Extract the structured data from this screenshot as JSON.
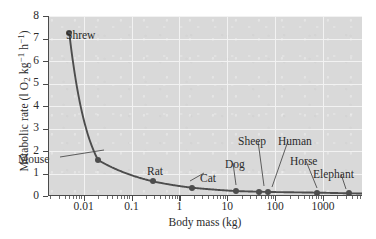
{
  "chart_data": {
    "type": "line",
    "title": "",
    "xlabel": "Body mass (kg)",
    "ylabel": "Metabolic rate (l O2 kg-1 h-1)",
    "ylabel_parts": {
      "lead": "Metabolic rate (l O",
      "sub_2": "2",
      "mid": " kg",
      "sup_1": "−1",
      "mid2": " h",
      "sup_2": "−1",
      "tail": ")"
    },
    "xscale": "log",
    "yscale": "linear",
    "xlim": [
      0.0018,
      6500
    ],
    "ylim": [
      0,
      8
    ],
    "grid": true,
    "legend": "none",
    "xticks": [
      "0.01",
      "0.1",
      "1",
      "10",
      "100",
      "1000"
    ],
    "xtick_values": [
      0.01,
      0.1,
      1,
      10,
      100,
      1000
    ],
    "yticks": [
      "0",
      "1",
      "2",
      "3",
      "4",
      "5",
      "6",
      "7",
      "8"
    ],
    "ytick_values": [
      0,
      1,
      2,
      3,
      4,
      5,
      6,
      7,
      8
    ],
    "series": [
      {
        "name": "Metabolic rate vs body mass",
        "points": [
          {
            "label": "Shrew",
            "x": 0.005,
            "y": 7.25
          },
          {
            "label": "Mouse",
            "x": 0.02,
            "y": 1.6
          },
          {
            "label": "Rat",
            "x": 0.28,
            "y": 0.65
          },
          {
            "label": "Cat",
            "x": 1.8,
            "y": 0.37
          },
          {
            "label": "Dog",
            "x": 15,
            "y": 0.22
          },
          {
            "label": "Sheep",
            "x": 45,
            "y": 0.19
          },
          {
            "label": "Human",
            "x": 70,
            "y": 0.18
          },
          {
            "label": "Horse",
            "x": 750,
            "y": 0.15
          },
          {
            "label": "Elephant",
            "x": 3500,
            "y": 0.12
          }
        ]
      }
    ],
    "annotations": [
      {
        "text": "Shrew",
        "anchor_x": 0.005,
        "anchor_y": 7.25,
        "leader": false
      },
      {
        "text": "Mouse",
        "anchor_x": 0.02,
        "anchor_y": 1.6,
        "leader": true
      },
      {
        "text": "Rat",
        "anchor_x": 0.28,
        "anchor_y": 0.65,
        "leader": false
      },
      {
        "text": "Cat",
        "anchor_x": 1.8,
        "anchor_y": 0.37,
        "leader": true
      },
      {
        "text": "Dog",
        "anchor_x": 15,
        "anchor_y": 0.22,
        "leader": true
      },
      {
        "text": "Sheep",
        "anchor_x": 45,
        "anchor_y": 0.19,
        "leader": true
      },
      {
        "text": "Human",
        "anchor_x": 70,
        "anchor_y": 0.18,
        "leader": true
      },
      {
        "text": "Horse",
        "anchor_x": 750,
        "anchor_y": 0.15,
        "leader": true
      },
      {
        "text": "Elephant",
        "anchor_x": 3500,
        "anchor_y": 0.12,
        "leader": true
      }
    ],
    "colors": {
      "plot_background": "#d9d9d9",
      "gridline": "#f2f2f2",
      "axis": "#4a4a4a",
      "curve": "#4d4d4d",
      "marker": "#4d4d4d",
      "text": "#2b2b2b",
      "page_background": "#ffffff"
    }
  }
}
